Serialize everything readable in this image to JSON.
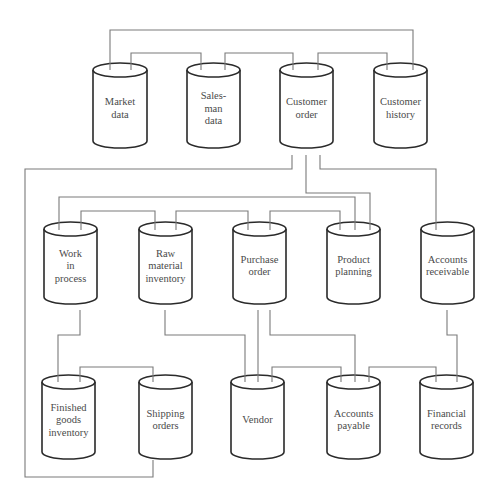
{
  "diagram": {
    "type": "data-store-relationship-diagram",
    "colors": {
      "line": "#7a7a7a",
      "outline": "#2a2a2a",
      "text": "#4a4a4a",
      "background": "#ffffff"
    },
    "stores": [
      {
        "id": "market_data",
        "lines": [
          "Market",
          "data"
        ],
        "x": 93,
        "y": 63,
        "w": 54,
        "h": 85
      },
      {
        "id": "salesman_data",
        "lines": [
          "Sales-",
          "man",
          "data"
        ],
        "x": 187,
        "y": 63,
        "w": 53,
        "h": 85
      },
      {
        "id": "customer_order",
        "lines": [
          "Customer",
          "order"
        ],
        "x": 280,
        "y": 63,
        "w": 53,
        "h": 85
      },
      {
        "id": "customer_history",
        "lines": [
          "Customer",
          "history"
        ],
        "x": 374,
        "y": 63,
        "w": 53,
        "h": 85
      },
      {
        "id": "work_in_process",
        "lines": [
          "Work",
          "in",
          "process"
        ],
        "x": 44,
        "y": 222,
        "w": 53,
        "h": 82
      },
      {
        "id": "raw_material_inventory",
        "lines": [
          "Raw",
          "material",
          "inventory"
        ],
        "x": 139,
        "y": 222,
        "w": 53,
        "h": 82
      },
      {
        "id": "purchase_order",
        "lines": [
          "Purchase",
          "order"
        ],
        "x": 233,
        "y": 222,
        "w": 53,
        "h": 82
      },
      {
        "id": "product_planning",
        "lines": [
          "Product",
          "planning"
        ],
        "x": 327,
        "y": 222,
        "w": 53,
        "h": 82
      },
      {
        "id": "accounts_receivable",
        "lines": [
          "Accounts",
          "receivable"
        ],
        "x": 421,
        "y": 222,
        "w": 53,
        "h": 82
      },
      {
        "id": "finished_goods_inventory",
        "lines": [
          "Finished",
          "goods",
          "inventory"
        ],
        "x": 42,
        "y": 375,
        "w": 53,
        "h": 84
      },
      {
        "id": "shipping_orders",
        "lines": [
          "Shipping",
          "orders"
        ],
        "x": 139,
        "y": 375,
        "w": 53,
        "h": 84
      },
      {
        "id": "vendor",
        "lines": [
          "Vendor"
        ],
        "x": 231,
        "y": 375,
        "w": 53,
        "h": 84
      },
      {
        "id": "accounts_payable",
        "lines": [
          "Accounts",
          "payable"
        ],
        "x": 327,
        "y": 375,
        "w": 53,
        "h": 84
      },
      {
        "id": "financial_records",
        "lines": [
          "Financial",
          "records"
        ],
        "x": 420,
        "y": 375,
        "w": 53,
        "h": 84
      }
    ],
    "connections": [
      {
        "from": "market_data",
        "to": "customer_history",
        "path": "M110,70 L110,30 L413,30 L413,70"
      },
      {
        "from": "market_data",
        "to": "salesman_data",
        "path": "M131,70 L131,53 L201,53 L201,70"
      },
      {
        "from": "salesman_data",
        "to": "customer_order",
        "path": "M225,70 L225,53 L293,53 L293,70"
      },
      {
        "from": "customer_order",
        "to": "customer_history",
        "path": "M318,70 L318,53 L387,53 L387,70"
      },
      {
        "from": "customer_order",
        "to": "shipping_orders",
        "path": "M292,155 L292,169 L25,169 L25,477 L153,477 L153,460"
      },
      {
        "from": "customer_order",
        "to": "product_planning",
        "path": "M306,155 L306,193 L370,193 L370,230"
      },
      {
        "from": "customer_order",
        "to": "accounts_receivable",
        "path": "M320,155 L320,169 L436,169 L436,230"
      },
      {
        "from": "work_in_process",
        "to": "product_planning",
        "path": "M59,230 L59,197 L355,197 L355,230"
      },
      {
        "from": "work_in_process",
        "to": "raw_material_inventory",
        "path": "M81,230 L81,211 L155,211 L155,230"
      },
      {
        "from": "raw_material_inventory",
        "to": "purchase_order",
        "path": "M176,230 L176,211 L248,211 L248,230"
      },
      {
        "from": "purchase_order",
        "to": "product_planning",
        "path": "M270,230 L270,211 L340,211 L340,230"
      },
      {
        "from": "work_in_process",
        "to": "finished_goods_inventory",
        "path": "M80,310 L80,335 L58,335 L58,382"
      },
      {
        "from": "raw_material_inventory",
        "to": "vendor",
        "path": "M165,310 L165,335 L245,335 L245,382"
      },
      {
        "from": "purchase_order",
        "to": "vendor",
        "path": "M258,310 L258,382"
      },
      {
        "from": "purchase_order",
        "to": "accounts_payable",
        "path": "M270,310 L270,335 L355,335 L355,382"
      },
      {
        "from": "accounts_receivable",
        "to": "financial_records",
        "path": "M447,310 L447,335 L457,335 L457,382"
      },
      {
        "from": "finished_goods_inventory",
        "to": "shipping_orders",
        "path": "M80,382 L80,367 L153,367 L153,382"
      },
      {
        "from": "vendor",
        "to": "accounts_payable",
        "path": "M272,382 L272,367 L341,367 L341,382"
      },
      {
        "from": "accounts_payable",
        "to": "financial_records",
        "path": "M369,382 L369,367 L436,367 L436,382"
      }
    ]
  }
}
